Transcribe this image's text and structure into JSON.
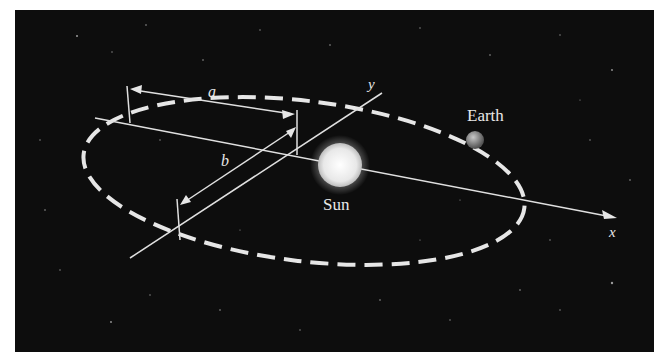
{
  "diagram": {
    "labels": {
      "semi_major": "a",
      "semi_minor": "b",
      "x_axis": "x",
      "y_axis": "y",
      "sun": "Sun",
      "earth": "Earth"
    },
    "colors": {
      "background": "#0d0d0d",
      "lines": "#e6e6e6",
      "sun": "#f4f4f4",
      "earth": "#8a8a8a"
    }
  }
}
